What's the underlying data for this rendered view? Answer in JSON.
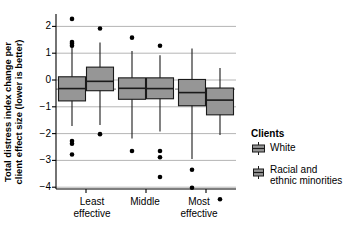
{
  "chart_data": {
    "type": "boxplot",
    "title": "",
    "xlabel": "",
    "ylabel": "Total distress index change per\nclient effect size (lower is better)",
    "ylim": [
      -4.75,
      2.6
    ],
    "yticks": [
      2,
      1,
      0,
      -1,
      -2,
      -3,
      -4
    ],
    "ytick_labels": [
      "2",
      "1",
      "0",
      "−1",
      "−2",
      "−3",
      "−4"
    ],
    "grid": "horizontal",
    "categories": [
      "Least\neffective",
      "Middle",
      "Most\neffective"
    ],
    "reference_line": {
      "value": -0.34,
      "style": "dashed",
      "color": "#808080"
    },
    "legend": {
      "title": "Clients",
      "position": "right",
      "entries": [
        {
          "label": "White",
          "color": "#969696"
        },
        {
          "label": "Racial and\nethnic minorities",
          "color": "#969696"
        }
      ]
    },
    "series": [
      {
        "name": "White",
        "boxes": [
          {
            "category": "Least\neffective",
            "min": -1.72,
            "q1": -0.78,
            "median": -0.32,
            "q3": 0.12,
            "max": 1.22,
            "outliers": [
              2.28,
              1.42,
              1.35,
              1.28,
              -2.28,
              -2.38,
              -2.78
            ]
          },
          {
            "category": "Middle",
            "min": -2.18,
            "q1": -0.72,
            "median": -0.31,
            "q3": 0.08,
            "max": 1.08,
            "outliers": [
              1.58,
              -2.65
            ]
          },
          {
            "category": "Most\neffective",
            "min": -2.95,
            "q1": -0.96,
            "median": -0.47,
            "q3": 0.02,
            "max": 1.18,
            "outliers": [
              -3.35,
              -4.02
            ]
          }
        ]
      },
      {
        "name": "Racial and\nethnic minorities",
        "boxes": [
          {
            "category": "Least\neffective",
            "min": -1.68,
            "q1": -0.4,
            "median": -0.05,
            "q3": 0.48,
            "max": 1.4,
            "outliers": [
              1.92,
              -2.02
            ]
          },
          {
            "category": "Middle",
            "min": -1.92,
            "q1": -0.7,
            "median": -0.32,
            "q3": 0.08,
            "max": 0.92,
            "outliers": [
              1.28,
              -2.65,
              -2.88,
              -3.62
            ]
          },
          {
            "category": "Most\neffective",
            "min": -2.05,
            "q1": -1.3,
            "median": -0.75,
            "q3": -0.3,
            "max": 0.45,
            "outliers": [
              -4.45
            ]
          }
        ]
      }
    ]
  },
  "axis": {
    "ytick_0": "2",
    "ytick_1": "1",
    "ytick_2": "0",
    "ytick_3": "−1",
    "ytick_4": "−2",
    "ytick_5": "−3",
    "ytick_6": "−4",
    "ylabel": "Total distress index change per\nclient effect size (lower is better)",
    "xtick_0": "Least\neffective",
    "xtick_1": "Middle",
    "xtick_2": "Most\neffective"
  },
  "legend": {
    "title": "Clients",
    "entry_0": "White",
    "entry_1": "Racial and\nethnic minorities"
  },
  "colors": {
    "box_fill": "#969696",
    "box_stroke": "#1a1a1a",
    "grid": "#b5b5b5",
    "axis": "#000000",
    "reference": "#8c8c8c",
    "outlier": "#000000"
  }
}
